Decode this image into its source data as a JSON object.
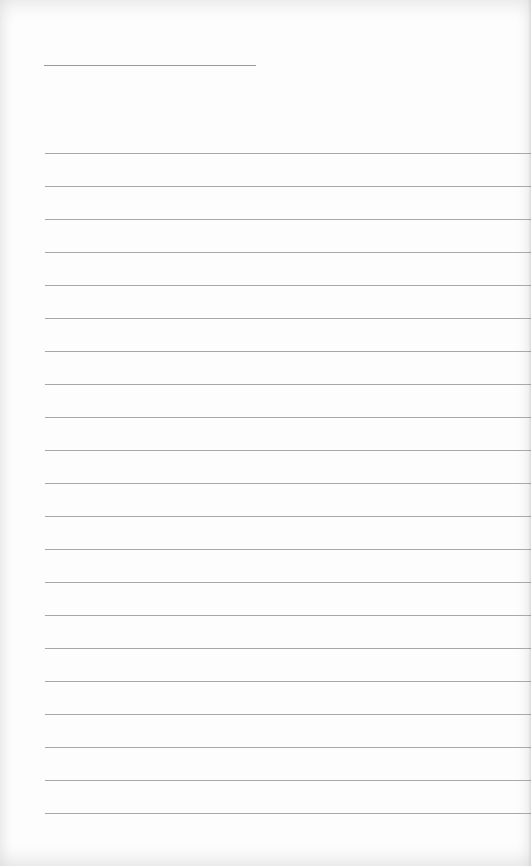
{
  "page": {
    "type": "lined-paper",
    "background_color": "#fdfdfd",
    "line_color": "#a8a8a8",
    "title_line": {
      "x": 44,
      "y": 65,
      "width": 212
    },
    "ruled_lines": {
      "count": 21,
      "start_y": 153,
      "spacing": 33,
      "left": 45
    },
    "text": ""
  }
}
